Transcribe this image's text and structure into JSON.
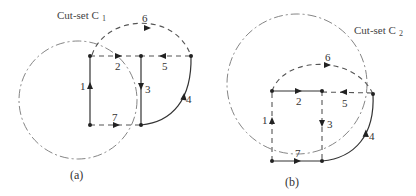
{
  "figure_a": {
    "cutset_label": "Cut-set C",
    "cutset_subscript": "1",
    "caption": "(a)",
    "edges": [
      {
        "id": "1",
        "label": "1",
        "style": "solid"
      },
      {
        "id": "2",
        "label": "2",
        "style": "dashed"
      },
      {
        "id": "3",
        "label": "3",
        "style": "solid"
      },
      {
        "id": "4",
        "label": "4",
        "style": "solid"
      },
      {
        "id": "5",
        "label": "5",
        "style": "dashed"
      },
      {
        "id": "6",
        "label": "6",
        "style": "dashed"
      },
      {
        "id": "7",
        "label": "7",
        "style": "dashed"
      }
    ]
  },
  "figure_b": {
    "cutset_label": "Cut-set C",
    "cutset_subscript": "2",
    "caption": "(b)",
    "edges": [
      {
        "id": "1",
        "label": "1",
        "style": "dashed"
      },
      {
        "id": "2",
        "label": "2",
        "style": "solid"
      },
      {
        "id": "3",
        "label": "3",
        "style": "dashed"
      },
      {
        "id": "4",
        "label": "4",
        "style": "solid"
      },
      {
        "id": "5",
        "label": "5",
        "style": "dashed"
      },
      {
        "id": "6",
        "label": "6",
        "style": "dashed"
      },
      {
        "id": "7",
        "label": "7",
        "style": "solid"
      }
    ]
  }
}
